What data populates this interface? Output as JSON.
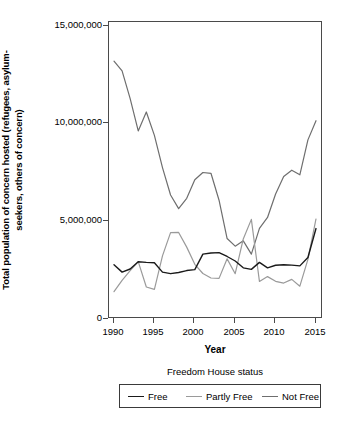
{
  "chart_data": {
    "type": "line",
    "title": "",
    "xlabel": "Year",
    "ylabel": "Total population of concern hosted (refugees, asylum-seekers, others of concern)",
    "ylabel_line1": "Total population of concern hosted (refugees, asylum-",
    "ylabel_line2": "seekers, others of concern)",
    "legend_title": "Freedom House status",
    "legend_position": "bottom",
    "grid": false,
    "xlim": [
      1990,
      2015
    ],
    "ylim": [
      0,
      15500000
    ],
    "xticks": [
      1990,
      1995,
      2000,
      2005,
      2010,
      2015
    ],
    "xtick_labels": [
      "1990",
      "1995",
      "2000",
      "2005",
      "2010",
      "2015"
    ],
    "yticks": [
      0,
      5000000,
      10000000,
      15000000
    ],
    "ytick_labels": [
      "0",
      "5,000,000",
      "10,000,000",
      "15,000,000"
    ],
    "x": [
      1990,
      1991,
      1992,
      1993,
      1994,
      1995,
      1996,
      1997,
      1998,
      1999,
      2000,
      2001,
      2002,
      2003,
      2004,
      2005,
      2006,
      2007,
      2008,
      2009,
      2010,
      2011,
      2012,
      2013,
      2014,
      2015
    ],
    "series": [
      {
        "name": "Free",
        "color": "#1a1a1a",
        "width": 1.4,
        "values": [
          2780000,
          2400000,
          2560000,
          2930000,
          2900000,
          2880000,
          2400000,
          2320000,
          2380000,
          2480000,
          2530000,
          3320000,
          3380000,
          3400000,
          3200000,
          2970000,
          2620000,
          2540000,
          2900000,
          2620000,
          2750000,
          2780000,
          2760000,
          2720000,
          3150000,
          4630000
        ]
      },
      {
        "name": "Partly Free",
        "color": "#9a9a9a",
        "width": 1.2,
        "values": [
          1400000,
          1980000,
          2480000,
          2940000,
          1640000,
          1520000,
          3230000,
          4420000,
          4430000,
          3680000,
          2800000,
          2330000,
          2100000,
          2080000,
          3080000,
          2320000,
          4100000,
          5100000,
          1920000,
          2170000,
          1930000,
          1840000,
          2030000,
          1680000,
          3050000,
          5120000
        ]
      },
      {
        "name": "Not Free",
        "color": "#6e6e6e",
        "width": 1.2,
        "values": [
          13200000,
          12700000,
          11280000,
          9630000,
          10600000,
          9400000,
          7750000,
          6350000,
          5650000,
          6180000,
          7130000,
          7500000,
          7460000,
          6080000,
          4120000,
          3730000,
          4000000,
          3320000,
          4640000,
          5200000,
          6400000,
          7300000,
          7620000,
          7380000,
          9170000,
          10150000
        ]
      }
    ]
  },
  "axes": {
    "x_title": "Year",
    "y_title_line1": "Total population of concern hosted (refugees, asylum-",
    "y_title_line2": "seekers, others of concern)"
  },
  "legend": {
    "title": "Freedom House status",
    "items": [
      {
        "label": "Free",
        "color": "#1a1a1a"
      },
      {
        "label": "Partly Free",
        "color": "#9a9a9a"
      },
      {
        "label": "Not Free",
        "color": "#6e6e6e"
      }
    ]
  }
}
